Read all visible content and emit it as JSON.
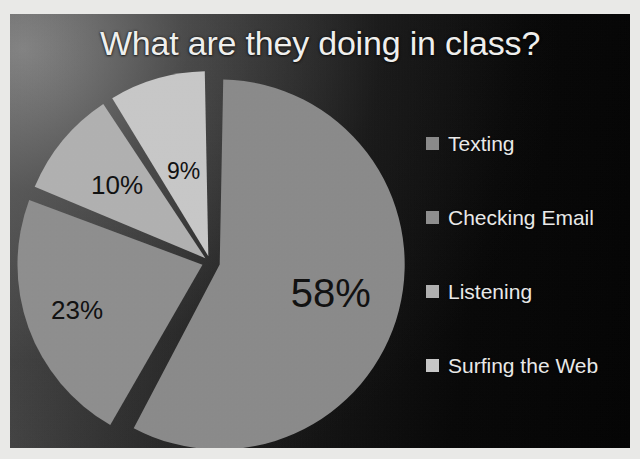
{
  "chart_data": {
    "type": "pie",
    "title": "What are they doing in class?",
    "categories": [
      "Texting",
      "Checking Email",
      "Listening",
      "Surfing the Web"
    ],
    "values": [
      58,
      23,
      10,
      9
    ],
    "value_labels": [
      "58%",
      "23%",
      "10%",
      "9%"
    ],
    "unit": "percent",
    "legend_position": "right",
    "grid": false,
    "xlabel": "",
    "ylabel": "",
    "slice_colors": [
      "#8b8b8b",
      "#8f8f8f",
      "#b2b2b2",
      "#c9c9c9"
    ],
    "separator_color": "#3a3a3a",
    "label_color": "#101010",
    "slices": [
      {
        "label": "Texting",
        "value": 58,
        "display": "58%",
        "color": "#8b8b8b"
      },
      {
        "label": "Checking Email",
        "value": 23,
        "display": "23%",
        "color": "#8f8f8f"
      },
      {
        "label": "Listening",
        "value": 10,
        "display": "10%",
        "color": "#b2b2b2"
      },
      {
        "label": "Surfing the Web",
        "value": 9,
        "display": "9%",
        "color": "#c9c9c9"
      }
    ]
  },
  "title": {
    "text": "What are they doing in class?",
    "color": "#f2f2f0"
  },
  "legend": {
    "items": [
      {
        "label": "Texting",
        "color": "#8b8b8b"
      },
      {
        "label": "Checking Email",
        "color": "#8f8f8f"
      },
      {
        "label": "Listening",
        "color": "#b2b2b2"
      },
      {
        "label": "Surfing the Web",
        "color": "#c9c9c9"
      }
    ]
  },
  "labels": {
    "l0": "58%",
    "l1": "23%",
    "l2": "10%",
    "l3": "9%"
  },
  "background": {
    "color": "#0a0a0a",
    "border_color": "#e9e9e7"
  }
}
